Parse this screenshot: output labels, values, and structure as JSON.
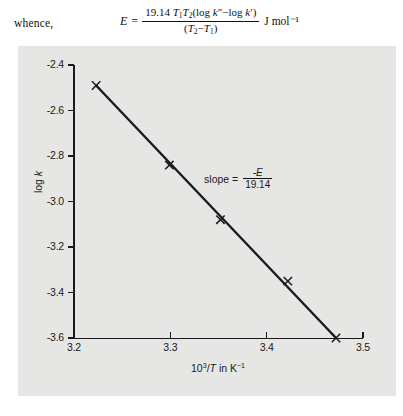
{
  "text_line": {
    "whence": "whence,",
    "equation": {
      "lhs": "E",
      "equals": "=",
      "numerator_prefix": "19.14",
      "numerator_body": "T1T2(log k″ − log k′)",
      "denominator": "(T2 − T1)",
      "units": "J mol⁻¹",
      "plain": "E = 19.14 T1T2(log k″ − log k′) / (T2 − T1) J mol⁻¹"
    }
  },
  "chart_data": {
    "type": "scatter",
    "title": "",
    "subtitle": "",
    "xlabel": "10³/T in K⁻¹",
    "ylabel": "log k",
    "xlim": [
      3.2,
      3.5
    ],
    "ylim": [
      -3.6,
      -2.4
    ],
    "xticks": [
      3.2,
      3.3,
      3.4,
      3.5
    ],
    "xticklabels": [
      "3.2",
      "3.3",
      "3.4",
      "3.5"
    ],
    "yticks": [
      -2.4,
      -2.6,
      -2.8,
      -3.0,
      -3.2,
      -3.4,
      -3.6
    ],
    "yticklabels": [
      "-2.4",
      "-2.6",
      "-2.8",
      "-3.0",
      "-3.2",
      "-3.4",
      "-3.6"
    ],
    "grid": false,
    "legend": null,
    "marker": "x",
    "marker_color": "#1a1a1a",
    "line_color": "#1a1a1a",
    "panel_color": "#e6e6e4",
    "series": [
      {
        "name": "log k vs 10³/T",
        "x": [
          3.223,
          3.299,
          3.352,
          3.422,
          3.472
        ],
        "y": [
          -2.49,
          -2.84,
          -3.08,
          -3.35,
          -3.6
        ]
      }
    ],
    "fit_line": {
      "x": [
        3.223,
        3.472
      ],
      "y": [
        -2.49,
        -3.6
      ]
    },
    "annotations": [
      {
        "name": "slope-annotation",
        "label": "slope =",
        "numerator": "-E",
        "denominator": "19.14",
        "x": 3.335,
        "y": -2.9
      }
    ]
  }
}
